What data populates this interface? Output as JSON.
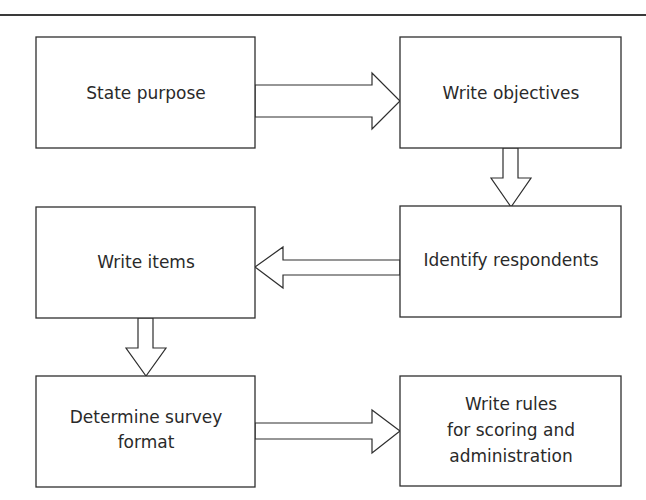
{
  "diagram": {
    "type": "flowchart",
    "colors": {
      "stroke": "#2e2e2e",
      "text": "#2a2a2a",
      "background": "#ffffff"
    },
    "steps": [
      {
        "id": "state-purpose",
        "lines": [
          "State purpose"
        ]
      },
      {
        "id": "write-objectives",
        "lines": [
          "Write objectives"
        ]
      },
      {
        "id": "identify-respondents",
        "lines": [
          "Identify respondents"
        ]
      },
      {
        "id": "write-items",
        "lines": [
          "Write items"
        ]
      },
      {
        "id": "determine-survey-format",
        "lines": [
          "Determine survey",
          "format"
        ]
      },
      {
        "id": "write-rules",
        "lines": [
          "Write rules",
          "for scoring and",
          "administration"
        ]
      }
    ],
    "connections": [
      {
        "from": "state-purpose",
        "to": "write-objectives",
        "direction": "right"
      },
      {
        "from": "write-objectives",
        "to": "identify-respondents",
        "direction": "down"
      },
      {
        "from": "identify-respondents",
        "to": "write-items",
        "direction": "left"
      },
      {
        "from": "write-items",
        "to": "determine-survey-format",
        "direction": "down"
      },
      {
        "from": "determine-survey-format",
        "to": "write-rules",
        "direction": "right"
      }
    ]
  }
}
